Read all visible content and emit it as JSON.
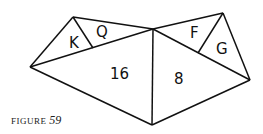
{
  "figure": {
    "caption_prefix": "FIGURE",
    "caption_number": "59",
    "stroke_color": "#111111",
    "labels": {
      "K": "K",
      "Q": "Q",
      "left_big": "16",
      "right_big": "8",
      "F": "F",
      "G": "G"
    },
    "vertices": {
      "left_apex": [
        30,
        67
      ],
      "k_top": [
        73,
        17
      ],
      "kq_divider_base": [
        93,
        47
      ],
      "center_top": [
        153,
        29
      ],
      "bottom": [
        152,
        125
      ],
      "right_top": [
        223,
        13
      ],
      "right_point": [
        250,
        80
      ],
      "fg_divider_base": [
        198,
        52
      ]
    }
  }
}
